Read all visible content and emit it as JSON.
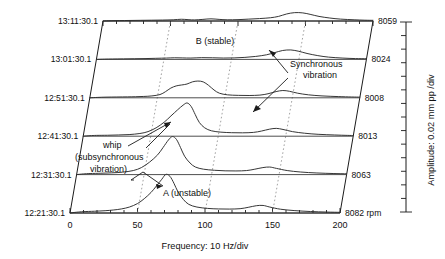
{
  "figure": {
    "kind": "waterfall-spectrum-cascade",
    "x_axis": {
      "label": "Frequency: 10 Hz/div",
      "ticks": [
        0,
        50,
        100,
        150,
        200
      ],
      "tick_labels": [
        "0",
        "50",
        "100",
        "150",
        "200"
      ],
      "min": 0,
      "max": 200,
      "minor_tick_step": 10
    },
    "right_axis": {
      "label": "Amplitude: 0.02 mm pp /div",
      "minor_tick_count": 13
    },
    "annotations": [
      {
        "id": "b-stable",
        "text": "B (stable)"
      },
      {
        "id": "synchronous",
        "line1": "Synchronous",
        "line2": "vibration"
      },
      {
        "id": "whip",
        "line1": "whip",
        "line2": "(subsynchronous",
        "line3": "vibration)"
      },
      {
        "id": "a-unstable",
        "text": "A (unstable)"
      }
    ],
    "colors": {
      "trace": "#2b2b2b",
      "axis": "#1b1b1b",
      "order_line": "#8a8a8a",
      "background": "#ffffff"
    }
  },
  "chart_data": {
    "type": "line",
    "title": "",
    "xlabel": "Frequency: 10 Hz/div",
    "ylabel": "Amplitude: 0.02 mm pp /div",
    "xlim": [
      0,
      200
    ],
    "grid": false,
    "legend": "none",
    "order_lines_hz": [
      50,
      100,
      150
    ],
    "series": [
      {
        "name": "13:11:30.1",
        "time": "13:11:30.1",
        "rpm": "8059",
        "row": 5,
        "points": [
          [
            0,
            0.0
          ],
          [
            6,
            0.02
          ],
          [
            12,
            0.03
          ],
          [
            20,
            0.04
          ],
          [
            28,
            0.05
          ],
          [
            36,
            0.06
          ],
          [
            44,
            0.07
          ],
          [
            52,
            0.09
          ],
          [
            58,
            0.13
          ],
          [
            63,
            0.1
          ],
          [
            68,
            0.08
          ],
          [
            74,
            0.12
          ],
          [
            80,
            0.16
          ],
          [
            86,
            0.12
          ],
          [
            92,
            0.09
          ],
          [
            100,
            0.1
          ],
          [
            108,
            0.14
          ],
          [
            116,
            0.18
          ],
          [
            124,
            0.24
          ],
          [
            130,
            0.34
          ],
          [
            136,
            0.52
          ],
          [
            142,
            0.62
          ],
          [
            148,
            0.6
          ],
          [
            154,
            0.48
          ],
          [
            160,
            0.34
          ],
          [
            168,
            0.22
          ],
          [
            176,
            0.14
          ],
          [
            186,
            0.09
          ],
          [
            194,
            0.06
          ],
          [
            200,
            0.05
          ]
        ]
      },
      {
        "name": "13:01:30.1",
        "time": "13:01:30.1",
        "rpm": "8024",
        "row": 4,
        "points": [
          [
            0,
            0.0
          ],
          [
            6,
            0.02
          ],
          [
            12,
            0.03
          ],
          [
            20,
            0.04
          ],
          [
            28,
            0.05
          ],
          [
            36,
            0.06
          ],
          [
            44,
            0.08
          ],
          [
            52,
            0.1
          ],
          [
            58,
            0.12
          ],
          [
            64,
            0.11
          ],
          [
            70,
            0.1
          ],
          [
            78,
            0.13
          ],
          [
            86,
            0.12
          ],
          [
            94,
            0.1
          ],
          [
            102,
            0.11
          ],
          [
            110,
            0.15
          ],
          [
            118,
            0.22
          ],
          [
            126,
            0.34
          ],
          [
            132,
            0.5
          ],
          [
            138,
            0.66
          ],
          [
            144,
            0.7
          ],
          [
            150,
            0.6
          ],
          [
            156,
            0.44
          ],
          [
            164,
            0.28
          ],
          [
            172,
            0.17
          ],
          [
            182,
            0.1
          ],
          [
            192,
            0.06
          ],
          [
            200,
            0.05
          ]
        ]
      },
      {
        "name": "12:51:30.1",
        "time": "12:51:30.1",
        "rpm": "8008",
        "row": 3,
        "peak_subsynchronous_hz": 78,
        "points": [
          [
            0,
            0.0
          ],
          [
            6,
            0.03
          ],
          [
            12,
            0.05
          ],
          [
            20,
            0.06
          ],
          [
            28,
            0.07
          ],
          [
            34,
            0.08
          ],
          [
            40,
            0.1
          ],
          [
            46,
            0.14
          ],
          [
            52,
            0.24
          ],
          [
            56,
            0.45
          ],
          [
            60,
            0.72
          ],
          [
            64,
            0.88
          ],
          [
            68,
            0.95
          ],
          [
            72,
            1.02
          ],
          [
            76,
            1.18
          ],
          [
            80,
            1.24
          ],
          [
            84,
            1.18
          ],
          [
            88,
            0.92
          ],
          [
            92,
            0.58
          ],
          [
            96,
            0.34
          ],
          [
            102,
            0.22
          ],
          [
            110,
            0.18
          ],
          [
            118,
            0.17
          ],
          [
            126,
            0.2
          ],
          [
            132,
            0.3
          ],
          [
            138,
            0.46
          ],
          [
            143,
            0.54
          ],
          [
            148,
            0.48
          ],
          [
            154,
            0.34
          ],
          [
            162,
            0.22
          ],
          [
            172,
            0.14
          ],
          [
            184,
            0.09
          ],
          [
            194,
            0.06
          ],
          [
            200,
            0.05
          ]
        ]
      },
      {
        "name": "12:41:30.1",
        "time": "12:41:30.1",
        "rpm": "8013",
        "row": 2,
        "peak_subsynchronous_hz": 76,
        "points": [
          [
            0,
            0.0
          ],
          [
            5,
            0.04
          ],
          [
            10,
            0.06
          ],
          [
            18,
            0.07
          ],
          [
            26,
            0.09
          ],
          [
            34,
            0.12
          ],
          [
            42,
            0.2
          ],
          [
            48,
            0.34
          ],
          [
            54,
            0.62
          ],
          [
            60,
            1.04
          ],
          [
            65,
            1.5
          ],
          [
            70,
            1.96
          ],
          [
            74,
            2.3
          ],
          [
            77,
            2.46
          ],
          [
            80,
            2.2
          ],
          [
            83,
            1.6
          ],
          [
            86,
            1.02
          ],
          [
            90,
            0.62
          ],
          [
            95,
            0.4
          ],
          [
            102,
            0.3
          ],
          [
            110,
            0.26
          ],
          [
            118,
            0.25
          ],
          [
            126,
            0.28
          ],
          [
            132,
            0.38
          ],
          [
            138,
            0.52
          ],
          [
            143,
            0.58
          ],
          [
            148,
            0.5
          ],
          [
            155,
            0.34
          ],
          [
            164,
            0.22
          ],
          [
            174,
            0.14
          ],
          [
            186,
            0.09
          ],
          [
            196,
            0.06
          ],
          [
            200,
            0.05
          ]
        ]
      },
      {
        "name": "12:31:30.1",
        "time": "12:31:30.1",
        "rpm": "8063",
        "row": 1,
        "peak_subsynchronous_hz": 72,
        "points": [
          [
            0,
            0.0
          ],
          [
            5,
            0.05
          ],
          [
            10,
            0.08
          ],
          [
            18,
            0.1
          ],
          [
            26,
            0.13
          ],
          [
            34,
            0.18
          ],
          [
            42,
            0.3
          ],
          [
            48,
            0.52
          ],
          [
            54,
            0.92
          ],
          [
            60,
            1.46
          ],
          [
            64,
            2.0
          ],
          [
            68,
            2.56
          ],
          [
            71,
            2.82
          ],
          [
            74,
            2.6
          ],
          [
            77,
            2.0
          ],
          [
            80,
            1.36
          ],
          [
            84,
            0.86
          ],
          [
            88,
            0.56
          ],
          [
            94,
            0.4
          ],
          [
            102,
            0.32
          ],
          [
            110,
            0.28
          ],
          [
            118,
            0.27
          ],
          [
            126,
            0.3
          ],
          [
            132,
            0.4
          ],
          [
            138,
            0.52
          ],
          [
            143,
            0.56
          ],
          [
            148,
            0.46
          ],
          [
            156,
            0.3
          ],
          [
            166,
            0.19
          ],
          [
            178,
            0.12
          ],
          [
            190,
            0.08
          ],
          [
            200,
            0.06
          ]
        ]
      },
      {
        "name": "12:21:30.1",
        "time": "12:21:30.1",
        "rpm": "8082 rpm",
        "row": 0,
        "peak_subsynchronous_hz": 70,
        "points": [
          [
            0,
            0.0
          ],
          [
            5,
            0.06
          ],
          [
            10,
            0.1
          ],
          [
            18,
            0.13
          ],
          [
            26,
            0.17
          ],
          [
            32,
            0.22
          ],
          [
            38,
            0.3
          ],
          [
            44,
            0.44
          ],
          [
            50,
            0.7
          ],
          [
            55,
            1.06
          ],
          [
            60,
            1.52
          ],
          [
            64,
            2.0
          ],
          [
            68,
            2.5
          ],
          [
            71,
            2.86
          ],
          [
            74,
            2.72
          ],
          [
            77,
            2.2
          ],
          [
            80,
            1.56
          ],
          [
            84,
            1.0
          ],
          [
            88,
            0.64
          ],
          [
            94,
            0.44
          ],
          [
            102,
            0.34
          ],
          [
            110,
            0.3
          ],
          [
            118,
            0.29
          ],
          [
            126,
            0.32
          ],
          [
            132,
            0.42
          ],
          [
            138,
            0.54
          ],
          [
            143,
            0.56
          ],
          [
            148,
            0.44
          ],
          [
            156,
            0.28
          ],
          [
            166,
            0.18
          ],
          [
            178,
            0.11
          ],
          [
            190,
            0.07
          ],
          [
            200,
            0.05
          ]
        ]
      }
    ]
  }
}
